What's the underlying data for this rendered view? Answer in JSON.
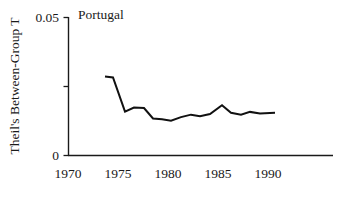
{
  "chart_data": {
    "type": "line",
    "title": "Portugal",
    "xlabel": "",
    "ylabel": "Theil's Between-Group T",
    "xlim": [
      1970,
      1996.1
    ],
    "ylim": [
      0,
      0.05
    ],
    "grid": false,
    "legend": null,
    "x_ticks": [
      1970,
      1975,
      1980,
      1985,
      1990
    ],
    "x_tick_labels": [
      "1970",
      "1975",
      "1980",
      "1985",
      "1990"
    ],
    "y_ticks": [
      0,
      0.025,
      0.05
    ],
    "y_tick_labels": [
      "0",
      "",
      "0.05"
    ],
    "series": [
      {
        "name": "Portugal",
        "x": [
          1973.7,
          1974.5,
          1975.7,
          1976.6,
          1977.6,
          1978.5,
          1979.4,
          1980.3,
          1981.3,
          1982.3,
          1983.2,
          1984.2,
          1985.4,
          1986.3,
          1987.3,
          1988.2,
          1989.2,
          1990.7
        ],
        "values": [
          0.0286,
          0.0283,
          0.0159,
          0.0174,
          0.0172,
          0.0134,
          0.0131,
          0.0126,
          0.0139,
          0.0148,
          0.0142,
          0.015,
          0.0182,
          0.0155,
          0.0148,
          0.0158,
          0.0152,
          0.0155
        ]
      }
    ]
  },
  "figure": {
    "title_label": "Portugal",
    "y_axis_label": "Theil's Between-Group T",
    "y_top_label": "0.05",
    "y_bottom_label": "0",
    "x_labels": [
      "1970",
      "1975",
      "1980",
      "1985",
      "1990"
    ]
  }
}
